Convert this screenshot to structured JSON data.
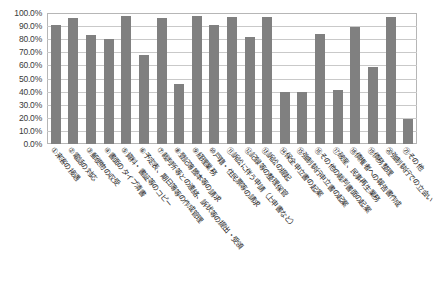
{
  "chart_data": {
    "type": "bar",
    "title": "",
    "subtitle": "",
    "xlabel": "",
    "ylabel": "",
    "ylim": [
      0,
      100
    ],
    "ytick_labels": [
      "100.0%",
      "90.0%",
      "80.0%",
      "70.0%",
      "60.0%",
      "50.0%",
      "40.0%",
      "30.0%",
      "20.0%",
      "10.0%",
      "0.0%"
    ],
    "ytick_values": [
      100,
      90,
      80,
      70,
      60,
      50,
      40,
      30,
      20,
      10,
      0
    ],
    "grid": true,
    "legend": false,
    "legend_position": "none",
    "bar_color": "#808080",
    "categories": [
      "①来客の接遇",
      "②電話の対応",
      "③郵便物の収受",
      "④書面のタイプ清書",
      "⑤資料・書証等のコピー",
      "⑥予定表、期日簿等の作成管理",
      "⑦裁判所等との連絡、訴状等の提出・受領",
      "⑧登記簿謄本等の請求",
      "⑨経理業務",
      "⑩戸籍・住民票等の請求",
      "⑪訴訟に伴う申請（上申書など）",
      "⑫記録等の整理保管",
      "⑬訴訟の提起",
      "⑭保全申立書の起案",
      "⑮強制執行申立書の起案",
      "⑯その他の裁判書面の起案",
      "⑰破産、民事再生業務",
      "⑱債権者への報告書作成",
      "⑲債務整理",
      "⑳強制執行での立会い",
      "㉑その他"
    ],
    "values": [
      91,
      96,
      83.5,
      80,
      98,
      68,
      96,
      46,
      98,
      91,
      97,
      82,
      97,
      40,
      40,
      84,
      41,
      89,
      59,
      97,
      19
    ]
  },
  "axis": {
    "y_axis_name": "percentage-axis",
    "x_axis_name": "category-axis"
  }
}
